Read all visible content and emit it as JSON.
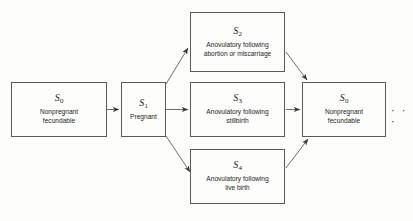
{
  "diagram": {
    "background_color": "#fdfdfc",
    "stroke_color": "#5a5a5a",
    "text_color": "#1d1d1d",
    "continuation_marker": "· · ·",
    "nodes": [
      {
        "id": "s0-left",
        "state": "S",
        "subscript": "0",
        "description": "Nonpregnant\nfecundable",
        "x": 11,
        "y": 82,
        "w": 96,
        "h": 55
      },
      {
        "id": "s1",
        "state": "S",
        "subscript": "1",
        "description": "Pregnant",
        "x": 121,
        "y": 82,
        "w": 45,
        "h": 55
      },
      {
        "id": "s2",
        "state": "S",
        "subscript": "2",
        "description": "Anovulatory following\nabortion or miscarriage",
        "x": 190,
        "y": 12,
        "w": 95,
        "h": 60
      },
      {
        "id": "s3",
        "state": "S",
        "subscript": "3",
        "description": "Anovulatory following\nstillbirth",
        "x": 190,
        "y": 82,
        "w": 95,
        "h": 55
      },
      {
        "id": "s4",
        "state": "S",
        "subscript": "4",
        "description": "Anovulatory following\nlive birth",
        "x": 190,
        "y": 149,
        "w": 95,
        "h": 55
      },
      {
        "id": "s0-right",
        "state": "S",
        "subscript": "0",
        "description": "Nonpregnant\nfecundable",
        "x": 302,
        "y": 82,
        "w": 84,
        "h": 55
      }
    ],
    "edges": [
      {
        "id": "s0-to-s1",
        "from": "s0-left",
        "to": "s1",
        "kind": "horizontal"
      },
      {
        "id": "s1-to-s2",
        "from": "s1",
        "to": "s2",
        "kind": "diagonal-up"
      },
      {
        "id": "s1-to-s3",
        "from": "s1",
        "to": "s3",
        "kind": "horizontal"
      },
      {
        "id": "s1-to-s4",
        "from": "s1",
        "to": "s4",
        "kind": "diagonal-down"
      },
      {
        "id": "s2-to-s0",
        "from": "s2",
        "to": "s0-right",
        "kind": "diagonal-down"
      },
      {
        "id": "s3-to-s0",
        "from": "s3",
        "to": "s0-right",
        "kind": "horizontal"
      },
      {
        "id": "s4-to-s0",
        "from": "s4",
        "to": "s0-right",
        "kind": "diagonal-up"
      }
    ]
  }
}
